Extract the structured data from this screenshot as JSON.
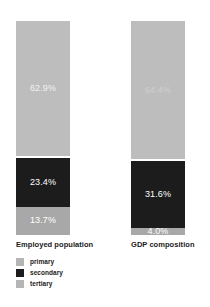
{
  "chart_data": {
    "type": "bar",
    "title": "",
    "subtitle": "",
    "xlabel": "",
    "ylabel": "",
    "ylim": [
      0,
      100
    ],
    "grid": false,
    "stacked": true,
    "stack_total": 100,
    "orientation": "vertical",
    "legend_position": "bottom-left",
    "categories": [
      "Employed population",
      "GDP composition"
    ],
    "series": [
      {
        "name": "primary",
        "color": "#a8a8a8",
        "values": [
          13.7,
          4.0
        ],
        "labels": [
          "13.7%",
          "4.0%"
        ]
      },
      {
        "name": "secondary",
        "color": "#1c1c1c",
        "values": [
          23.4,
          31.6
        ],
        "labels": [
          "23.4%",
          "31.6%"
        ]
      },
      {
        "name": "tertiary",
        "color": "#bdbdbd",
        "values": [
          62.9,
          64.4
        ],
        "labels": [
          "62.9%",
          "64.4%"
        ]
      }
    ]
  },
  "bars": [
    {
      "category": "Employed population",
      "axis_label": "Employed population",
      "segments": [
        {
          "series": "primary",
          "value": 13.7,
          "label": "13.7%",
          "color": "#a8a8a8",
          "label_color": "#ffffff"
        },
        {
          "series": "secondary",
          "value": 23.4,
          "label": "23.4%",
          "color": "#1c1c1c",
          "label_color": "#ffffff"
        },
        {
          "series": "tertiary",
          "value": 62.9,
          "label": "62.9%",
          "color": "#bdbdbd",
          "label_color": "#f2f2f2"
        }
      ]
    },
    {
      "category": "GDP composition",
      "axis_label": "GDP composition",
      "segments": [
        {
          "series": "primary",
          "value": 4.0,
          "label": "4.0%",
          "color": "#a8a8a8",
          "label_color": "#ffffff"
        },
        {
          "series": "secondary",
          "value": 31.6,
          "label": "31.6%",
          "color": "#1c1c1c",
          "label_color": "#ffffff"
        },
        {
          "series": "tertiary",
          "value": 64.4,
          "label": "64.4%",
          "color": "#bdbdbd",
          "label_color": "#cfcfcf"
        }
      ]
    }
  ],
  "legend": {
    "items": [
      {
        "label": "primary",
        "color": "#b5b5b5"
      },
      {
        "label": "secondary",
        "color": "#1c1c1c"
      },
      {
        "label": "tertiary",
        "color": "#b5b5b5"
      }
    ]
  },
  "colors": {
    "primary": "#a8a8a8",
    "secondary": "#1c1c1c",
    "tertiary": "#bdbdbd",
    "background": "#ffffff",
    "text": "#1a1a1a"
  }
}
